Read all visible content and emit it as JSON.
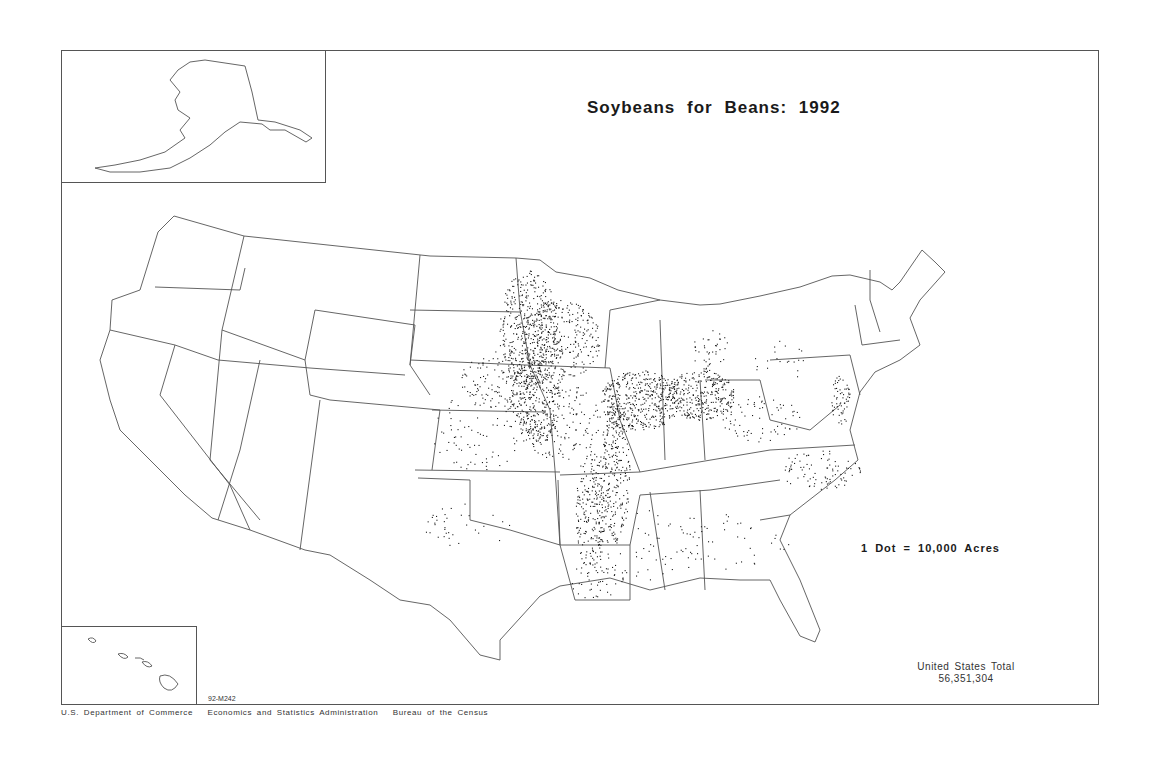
{
  "map": {
    "title": "Soybeans for Beans: 1992",
    "legend": "1 Dot = 10,000 Acres",
    "total_label": "United States Total",
    "total_value": "56,351,304",
    "map_code": "92-M242",
    "credit": "U.S. Department of Commerce   Economics and Statistics Administration   Bureau of the Census",
    "insets": [
      "Alaska",
      "Hawaii"
    ],
    "colors": {
      "outline": "#555555",
      "dot": "#1a1a1a",
      "background": "#ffffff"
    }
  },
  "chart_data": {
    "type": "dot-density-map",
    "title": "Soybeans for Beans: 1992",
    "unit": "1 Dot = 10,000 Acres",
    "total_acres": 56351304,
    "regions_of_high_density": [
      "Minnesota/Iowa/Red River corridor",
      "Illinois",
      "Indiana",
      "Ohio",
      "Mississippi Delta (Arkansas/Mississippi/Missouri bootheel)"
    ],
    "regions_of_medium_density": [
      "Nebraska (east)",
      "Kansas (east)",
      "Missouri",
      "Kentucky",
      "Tennessee",
      "Maryland/Delaware",
      "North Carolina",
      "Louisiana"
    ],
    "regions_of_low_density": [
      "Georgia",
      "South Carolina",
      "Alabama",
      "Michigan",
      "Pennsylvania",
      "Oklahoma",
      "Texas"
    ]
  }
}
